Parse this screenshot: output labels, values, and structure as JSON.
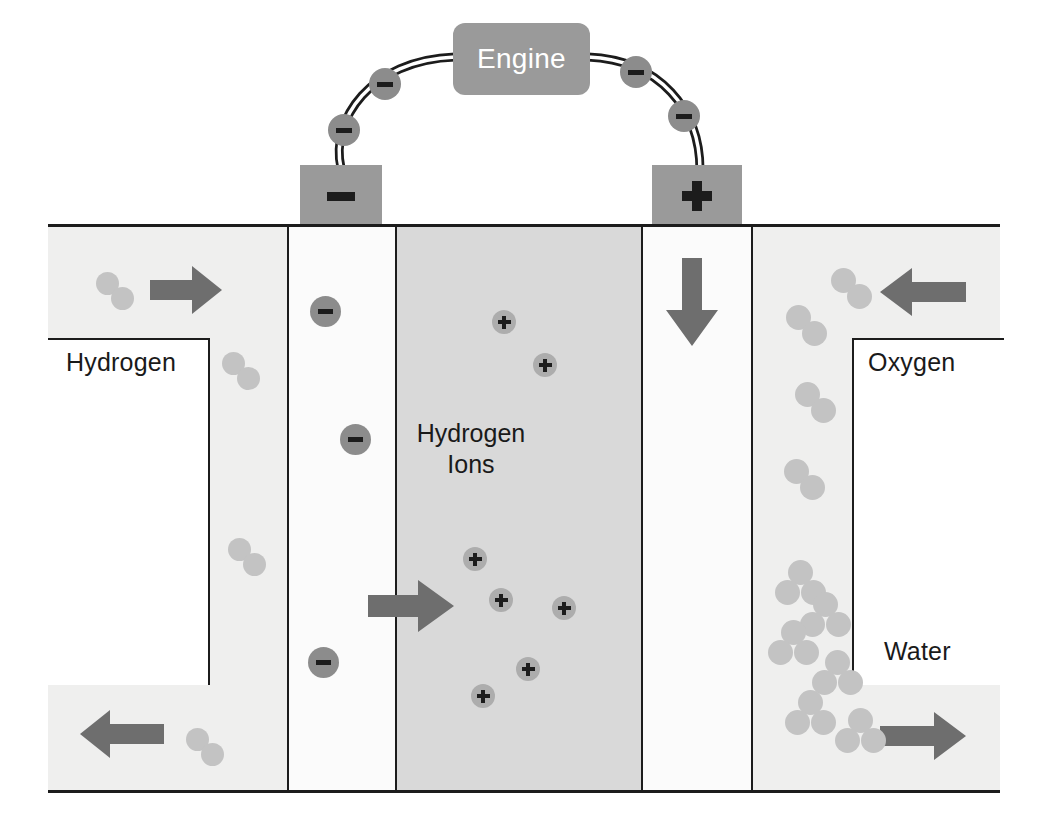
{
  "diagram": {
    "engine": {
      "label": "Engine"
    },
    "terminals": {
      "negative": {
        "label": "–",
        "name": "anode-terminal"
      },
      "positive": {
        "label": "+",
        "name": "cathode-terminal"
      }
    },
    "labels": {
      "hydrogen": "Hydrogen",
      "oxygen": "Oxygen",
      "water": "Water",
      "hydrogen_ions_line1": "Hydrogen",
      "hydrogen_ions_line2": "Ions"
    },
    "charges": {
      "electron_symbol": "−",
      "ion_symbol": "+"
    },
    "colors": {
      "gas_channel": "#efefee",
      "electrode": "#fbfbfb",
      "membrane": "#d9d9d9",
      "arrow": "#6e6e6e",
      "molecule": "#c3c3c3",
      "electron": "#8c8c8c",
      "ion": "#adadad",
      "terminal": "#9a9a9a",
      "engine": "#9a9a9a",
      "outline": "#1c1c1c",
      "engine_text": "#ffffff"
    },
    "columns": [
      {
        "name": "hydrogen-inlet-channel",
        "x": 0,
        "width": 240
      },
      {
        "name": "anode-electrode",
        "x": 240,
        "width": 108
      },
      {
        "name": "proton-exchange-membrane",
        "x": 348,
        "width": 246
      },
      {
        "name": "cathode-electrode",
        "x": 594,
        "width": 110
      },
      {
        "name": "oxygen-water-channel",
        "x": 704,
        "width": 248
      }
    ],
    "flow_arrows": [
      {
        "name": "hydrogen-inlet-arrow",
        "direction": "right",
        "x": 150,
        "y": 266,
        "w": 70,
        "h": 48
      },
      {
        "name": "hydrogen-outlet-arrow",
        "direction": "left",
        "x": 80,
        "y": 710,
        "w": 82,
        "h": 48
      },
      {
        "name": "electron-down-arrow",
        "direction": "down",
        "x": 666,
        "y": 258,
        "w": 50,
        "h": 86
      },
      {
        "name": "oxygen-inlet-arrow",
        "direction": "left",
        "x": 880,
        "y": 268,
        "w": 84,
        "h": 48
      },
      {
        "name": "water-outlet-arrow",
        "direction": "right",
        "x": 880,
        "y": 712,
        "w": 84,
        "h": 48
      },
      {
        "name": "proton-migration-arrow",
        "direction": "right",
        "x": 368,
        "y": 580,
        "w": 84,
        "h": 52
      }
    ],
    "wire_electrons": [
      {
        "name": "wire-electron-1",
        "x": 328,
        "y": 114
      },
      {
        "name": "wire-electron-2",
        "x": 369,
        "y": 68
      },
      {
        "name": "wire-electron-3",
        "x": 620,
        "y": 56
      },
      {
        "name": "wire-electron-4",
        "x": 668,
        "y": 100
      }
    ],
    "anode_electrons": [
      {
        "name": "anode-electron-1",
        "x": 310,
        "y": 296
      },
      {
        "name": "anode-electron-2",
        "x": 340,
        "y": 424
      },
      {
        "name": "anode-electron-3",
        "x": 308,
        "y": 647
      }
    ],
    "hydrogen_molecules": [
      {
        "name": "hydrogen-molecule-1",
        "x": 96,
        "y": 272
      },
      {
        "name": "hydrogen-molecule-2",
        "x": 222,
        "y": 352
      },
      {
        "name": "hydrogen-molecule-3",
        "x": 228,
        "y": 538
      },
      {
        "name": "hydrogen-molecule-4",
        "x": 186,
        "y": 728
      }
    ],
    "hydrogen_ions": [
      {
        "name": "hydrogen-ion-1",
        "x": 492,
        "y": 310
      },
      {
        "name": "hydrogen-ion-2",
        "x": 533,
        "y": 353
      },
      {
        "name": "hydrogen-ion-3",
        "x": 463,
        "y": 547
      },
      {
        "name": "hydrogen-ion-4",
        "x": 489,
        "y": 588
      },
      {
        "name": "hydrogen-ion-5",
        "x": 552,
        "y": 596
      },
      {
        "name": "hydrogen-ion-6",
        "x": 516,
        "y": 657
      },
      {
        "name": "hydrogen-ion-7",
        "x": 471,
        "y": 684
      }
    ],
    "oxygen_molecules": [
      {
        "name": "oxygen-molecule-1",
        "x": 831,
        "y": 268
      },
      {
        "name": "oxygen-molecule-2",
        "x": 786,
        "y": 305
      },
      {
        "name": "oxygen-molecule-3",
        "x": 795,
        "y": 382
      },
      {
        "name": "oxygen-molecule-4",
        "x": 784,
        "y": 459
      }
    ],
    "water_molecules": [
      {
        "name": "water-molecule-1",
        "x": 775,
        "y": 560
      },
      {
        "name": "water-molecule-2",
        "x": 800,
        "y": 592
      },
      {
        "name": "water-molecule-3",
        "x": 768,
        "y": 620
      },
      {
        "name": "water-molecule-4",
        "x": 812,
        "y": 650
      },
      {
        "name": "water-molecule-5",
        "x": 785,
        "y": 690
      },
      {
        "name": "water-molecule-6",
        "x": 835,
        "y": 708
      }
    ]
  }
}
